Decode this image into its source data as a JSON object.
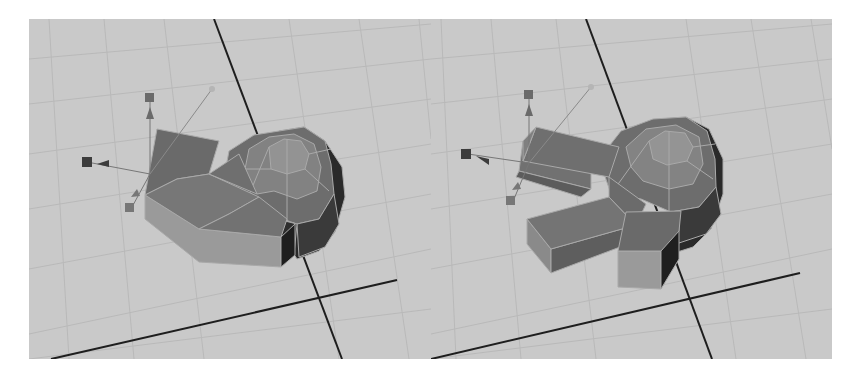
{
  "figure": {
    "panels": [
      {
        "id": "before",
        "state": "faces selected with move manipulator",
        "manipulator": "move-tool-gizmo"
      },
      {
        "id": "after",
        "state": "two faces extruded into arms",
        "manipulator": "move-tool-gizmo"
      }
    ]
  },
  "colors": {
    "background_white": "#ffffff",
    "viewport_bg": "#c9c9c9",
    "grid_line": "#b8b8b8",
    "axis_line": "#1e1e1e",
    "mesh_light": "#8e8e8e",
    "mesh_mid": "#7a7a7a",
    "mesh_dark": "#5e5e5e",
    "mesh_shadow": "#222222",
    "mesh_edge": "#a9a9a9",
    "side_face": "#9a9a9a",
    "manipulator": "#555555"
  }
}
